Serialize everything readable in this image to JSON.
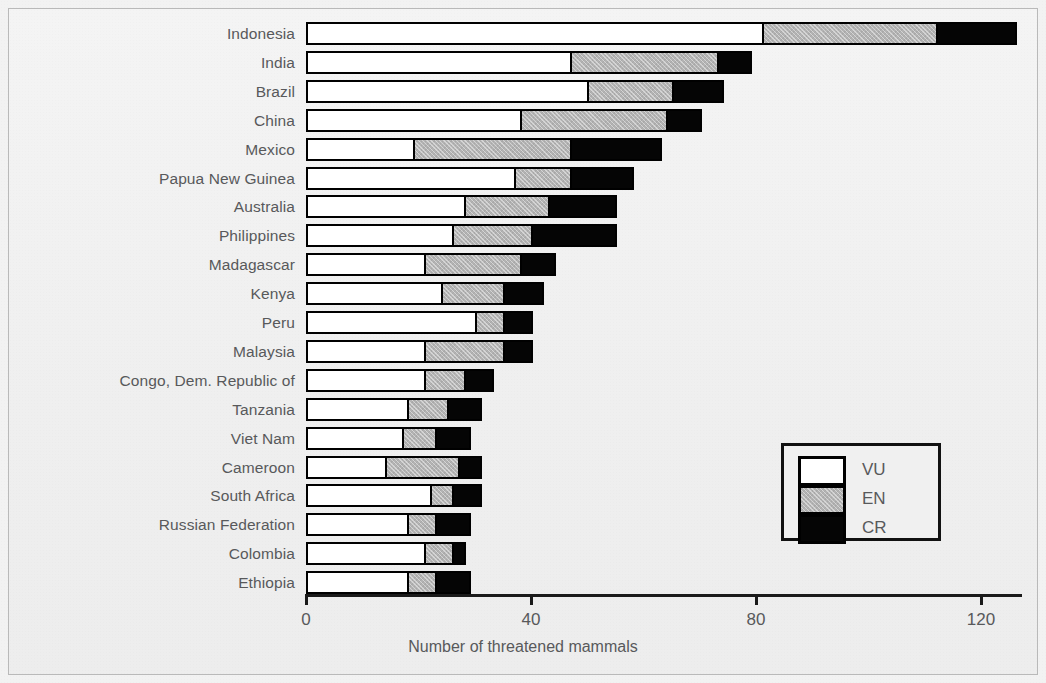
{
  "chart_data": {
    "type": "bar",
    "orientation": "horizontal",
    "stacked": true,
    "title": "",
    "xlabel": "Number of threatened mammals",
    "ylabel": "",
    "xlim": [
      0,
      130
    ],
    "xticks": [
      0,
      40,
      80,
      120
    ],
    "xtick_labels": [
      "0",
      "40",
      "80",
      "120"
    ],
    "grid": false,
    "legend_position": "inside-right-lower",
    "categories": [
      "Indonesia",
      "India",
      "Brazil",
      "China",
      "Mexico",
      "Papua New Guinea",
      "Australia",
      "Philippines",
      "Madagascar",
      "Kenya",
      "Peru",
      "Malaysia",
      "Congo, Dem. Republic of",
      "Tanzania",
      "Viet Nam",
      "Cameroon",
      "South Africa",
      "Russian Federation",
      "Colombia",
      "Ethiopia"
    ],
    "series": [
      {
        "name": "VU",
        "color": "#ffffff",
        "values": [
          81,
          47,
          50,
          38,
          19,
          37,
          28,
          26,
          21,
          24,
          30,
          21,
          21,
          18,
          17,
          14,
          22,
          18,
          21,
          18
        ]
      },
      {
        "name": "EN",
        "color": "#b3b3b3",
        "values": [
          31,
          26,
          15,
          26,
          28,
          10,
          15,
          14,
          17,
          11,
          5,
          14,
          7,
          7,
          6,
          13,
          4,
          5,
          5,
          5
        ]
      },
      {
        "name": "CR",
        "color": "#050505",
        "values": [
          14,
          6,
          9,
          6,
          16,
          11,
          12,
          15,
          6,
          7,
          5,
          5,
          5,
          6,
          6,
          4,
          5,
          6,
          2,
          6
        ]
      }
    ],
    "totals": [
      126,
      79,
      74,
      70,
      63,
      58,
      55,
      55,
      44,
      42,
      40,
      40,
      33,
      31,
      29,
      31,
      31,
      29,
      28,
      29
    ],
    "legend_entries": [
      {
        "label": "VU",
        "swatch": "white"
      },
      {
        "label": "EN",
        "swatch": "gray"
      },
      {
        "label": "CR",
        "swatch": "black"
      }
    ]
  }
}
